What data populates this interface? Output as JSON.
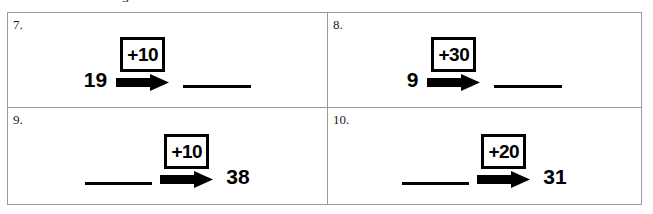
{
  "page": {
    "cut_off_heading": "use when counting to solve.",
    "background_color": "#ffffff",
    "grid_border_color": "#9a9a9a",
    "ink_color": "#000000"
  },
  "problems": [
    {
      "number": "7.",
      "left_term": "19",
      "operator": "+10",
      "right_term": "",
      "left_is_blank": false,
      "right_is_blank": true
    },
    {
      "number": "8.",
      "left_term": "9",
      "operator": "+30",
      "right_term": "",
      "left_is_blank": false,
      "right_is_blank": true
    },
    {
      "number": "9.",
      "left_term": "",
      "operator": "+10",
      "right_term": "38",
      "left_is_blank": true,
      "right_is_blank": false
    },
    {
      "number": "10.",
      "left_term": "",
      "operator": "+20",
      "right_term": "31",
      "left_is_blank": true,
      "right_is_blank": false
    }
  ]
}
